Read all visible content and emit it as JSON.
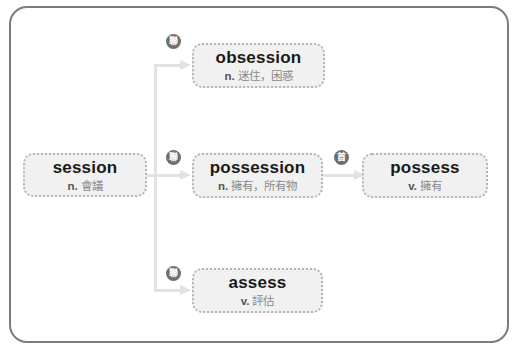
{
  "diagram": {
    "colors": {
      "frame_border": "#7c7c7c",
      "node_fill": "#f1f1f1",
      "node_border": "#b5b5b5",
      "connector": "#e2e2e2",
      "badge_fill": "#6f6f6f",
      "word_text": "#1a1a1a",
      "definition_text": "#8a8a8a"
    },
    "root": {
      "word": "session",
      "pos": "n.",
      "definition": "會議"
    },
    "branches": [
      {
        "badge": "聯",
        "badge_meaning": "related",
        "word": "obsession",
        "pos": "n.",
        "definition": "迷住，困惑"
      },
      {
        "badge": "聯",
        "badge_meaning": "related",
        "word": "possession",
        "pos": "n.",
        "definition": "擁有，所有物",
        "child": {
          "badge": "首",
          "badge_meaning": "prefix",
          "word": "possess",
          "pos": "v.",
          "definition": "擁有"
        }
      },
      {
        "badge": "聯",
        "badge_meaning": "related",
        "word": "assess",
        "pos": "v.",
        "definition": "評估"
      }
    ]
  }
}
